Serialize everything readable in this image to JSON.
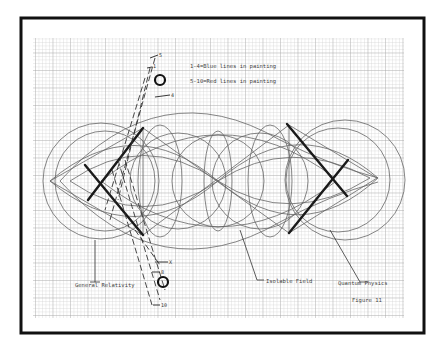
{
  "figure": {
    "legend": [
      {
        "text": "1-4=Blue lines in painting"
      },
      {
        "text": "5-10=Red lines in painting"
      }
    ],
    "labels": {
      "general_relativity": "General Relativity",
      "isolable_field": "Isolable Field",
      "quantum_physics": "Quantum Physics",
      "figure_number": "Figure 11"
    },
    "markers": {
      "top_5": "5",
      "top_1": "1",
      "top_circled": "3",
      "top_4": "4",
      "bottom_x": "X",
      "bottom_8": "8",
      "bottom_circled": "8",
      "bottom_10": "10"
    },
    "colors": {
      "frame": "#111111",
      "grid": "#b8b8b8",
      "lines": "#555555",
      "thick": "#1a1a1a"
    }
  }
}
